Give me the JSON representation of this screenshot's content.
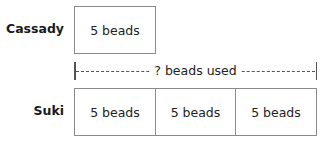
{
  "diagram": {
    "type": "tape-diagram",
    "rows": [
      {
        "name": "Cassady",
        "segments": [
          "5 beads"
        ]
      },
      {
        "name": "Suki",
        "segments": [
          "5 beads",
          "5 beads",
          "5 beads"
        ]
      }
    ],
    "bracket": {
      "label": "? beads used",
      "spans_row": "Suki"
    }
  },
  "colors": {
    "box_border": "#8a8a8a",
    "text": "#222222",
    "bracket": "#555555"
  }
}
